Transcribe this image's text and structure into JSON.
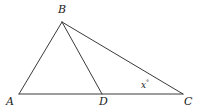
{
  "figure": {
    "kind": "geometry-diagram",
    "shape": "triangle-with-cevian",
    "width": 201,
    "height": 111,
    "background_color": "#ffffff",
    "stroke_color": "#3a3a3a",
    "stroke_width": 1,
    "text_color": "#1a1a1a"
  },
  "labels": {
    "a": "A",
    "b": "B",
    "c": "C",
    "d": "D",
    "angle_x": "x",
    "degree_symbol": "°"
  },
  "points": {
    "A": {
      "x": 19,
      "y": 94
    },
    "B": {
      "x": 62,
      "y": 22
    },
    "C": {
      "x": 183,
      "y": 94
    },
    "D": {
      "x": 102,
      "y": 94
    }
  },
  "segments": [
    {
      "name": "AB",
      "from": "A",
      "to": "B"
    },
    {
      "name": "BC",
      "from": "B",
      "to": "C"
    },
    {
      "name": "AC",
      "from": "A",
      "to": "C"
    },
    {
      "name": "BD",
      "from": "B",
      "to": "D"
    }
  ],
  "angles": [
    {
      "name": "angle-x",
      "at_vertex": "C",
      "label": "x°"
    }
  ]
}
